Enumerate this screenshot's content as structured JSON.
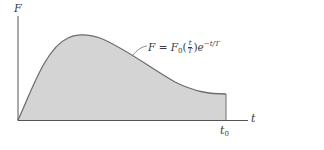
{
  "figure": {
    "y_axis_label": "F",
    "x_axis_label": "t",
    "x_marker_label": "t",
    "x_marker_subscript": "0",
    "curve_equation": {
      "lhs": "F",
      "eq": " = ",
      "coef": "F",
      "coef_sub": "0",
      "frac_num": "t",
      "frac_den": "T",
      "exp_base": "e",
      "exp_power": "−t/T"
    },
    "colors": {
      "fill": "#d4d4d4",
      "curve": "#6e6e6e",
      "axis": "#555555",
      "text": "#3a3a3a"
    }
  }
}
